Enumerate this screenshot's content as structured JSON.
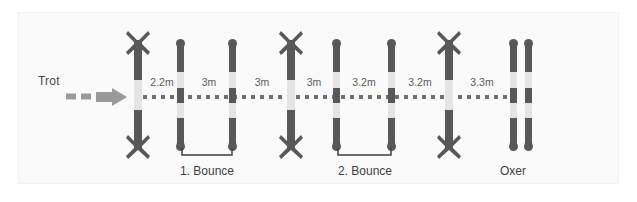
{
  "diagram": {
    "background_color": "#ffffff",
    "panel_color": "#fafafa",
    "pole_dark_color": "#58585a",
    "pole_light_color": "#e4e4e4",
    "track_color": "#6f6f6f",
    "text_color": "#4a4a4a"
  },
  "approach": {
    "label": "Trot",
    "arrow_name": "trot-direction-arrow"
  },
  "distances": [
    {
      "id": "d1",
      "value": "2.2m",
      "from": "cross-rail-1",
      "to": "bounce-1-pole-a"
    },
    {
      "id": "d2",
      "value": "3m",
      "from": "bounce-1-pole-a",
      "to": "bounce-1-pole-b"
    },
    {
      "id": "d3",
      "value": "3m",
      "from": "bounce-1-pole-b",
      "to": "cross-rail-2"
    },
    {
      "id": "d4",
      "value": "3m",
      "from": "cross-rail-2",
      "to": "bounce-2-pole-a"
    },
    {
      "id": "d5",
      "value": "3.2m",
      "from": "bounce-2-pole-a",
      "to": "bounce-2-pole-b"
    },
    {
      "id": "d6",
      "value": "3.2m",
      "from": "bounce-2-pole-b",
      "to": "cross-rail-3"
    },
    {
      "id": "d7",
      "value": "3.3m",
      "from": "cross-rail-3",
      "to": "oxer"
    }
  ],
  "obstacles": [
    {
      "id": "cross-rail-1",
      "type": "cross-rail",
      "caption": ""
    },
    {
      "id": "bounce-1",
      "type": "bounce-pair",
      "caption": "1. Bounce"
    },
    {
      "id": "cross-rail-2",
      "type": "cross-rail",
      "caption": ""
    },
    {
      "id": "bounce-2",
      "type": "bounce-pair",
      "caption": "2. Bounce"
    },
    {
      "id": "cross-rail-3",
      "type": "cross-rail",
      "caption": ""
    },
    {
      "id": "oxer",
      "type": "oxer",
      "caption": "Oxer"
    }
  ],
  "captions": {
    "bounce_1": "1. Bounce",
    "bounce_2": "2. Bounce",
    "oxer": "Oxer"
  }
}
